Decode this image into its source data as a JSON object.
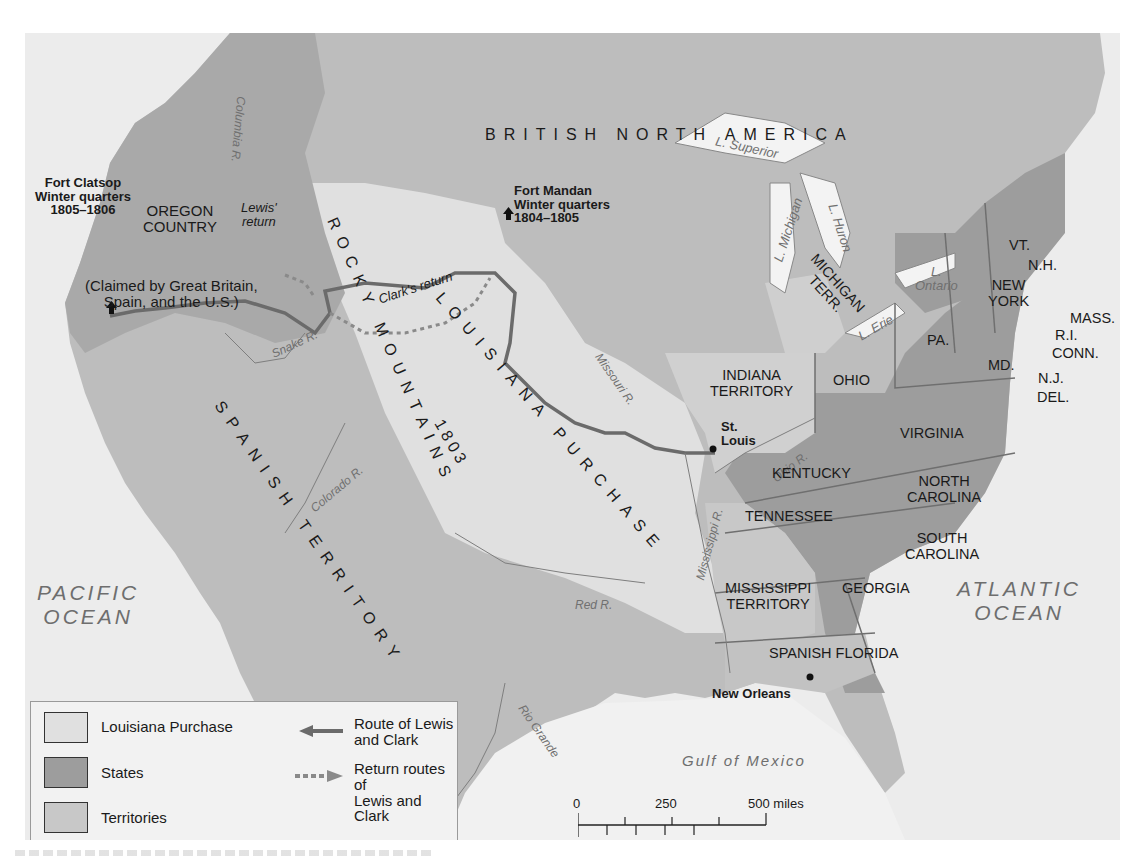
{
  "map": {
    "title_region": "BRITISH NORTH AMERICA",
    "colors": {
      "background": "#ececec",
      "louisiana_purchase": "#e0e0e0",
      "states": "#9d9d9d",
      "territories": "#c8c8c8",
      "spanish_territory": "#bdbdbd",
      "water": "#f3f3f3",
      "route": "#6b6b6b",
      "return_route": "#8a8a8a"
    },
    "oceans": {
      "pacific": [
        "PACIFIC",
        "OCEAN"
      ],
      "atlantic": [
        "ATLANTIC",
        "OCEAN"
      ],
      "gulf": "Gulf of Mexico"
    },
    "regions": {
      "oregon_country": [
        "OREGON",
        "COUNTRY"
      ],
      "oregon_claim": [
        "(Claimed by Great Britain,",
        "Spain, and the U.S.)"
      ],
      "rocky_mountains": "ROCKY MOUNTAINS",
      "louisiana_purchase": "LOUISIANA PURCHASE",
      "louisiana_year": "1803",
      "spanish_territory": "SPANISH TERRITORY"
    },
    "forts": [
      {
        "name": "Fort Clatsop",
        "sub": "Winter quarters",
        "years": "1805–1806"
      },
      {
        "name": "Fort Mandan",
        "sub": "Winter quarters",
        "years": "1804–1805"
      }
    ],
    "cities": {
      "st_louis": [
        "St.",
        "Louis"
      ],
      "new_orleans": "New Orleans"
    },
    "route_labels": {
      "lewis_return": [
        "Lewis'",
        "return"
      ],
      "clark_return": "Clark's return"
    },
    "rivers": {
      "columbia": "Columbia R.",
      "snake": "Snake R.",
      "colorado": "Colorado R.",
      "missouri": "Missouri R.",
      "mississippi": "Mississippi R.",
      "ohio": "Ohio R.",
      "red": "Red R.",
      "rio_grande": "Rio Grande"
    },
    "lakes": {
      "superior": "L. Superior",
      "michigan": "L. Michigan",
      "huron": "L. Huron",
      "erie": "L. Erie",
      "ontario": [
        "L.",
        "Ontario"
      ]
    },
    "states": {
      "vt": "VT.",
      "nh": "N.H.",
      "mass": "MASS.",
      "ri": "R.I.",
      "conn": "CONN.",
      "ny": [
        "NEW",
        "YORK"
      ],
      "nj": "N.J.",
      "pa": "PA.",
      "md": "MD.",
      "del": "DEL.",
      "ohio": "OHIO",
      "virginia": "VIRGINIA",
      "kentucky": "KENTUCKY",
      "nc": [
        "NORTH",
        "CAROLINA"
      ],
      "tennessee": "TENNESSEE",
      "sc": [
        "SOUTH",
        "CAROLINA"
      ],
      "georgia": "GEORGIA"
    },
    "territories": {
      "michigan": [
        "MICHIGAN",
        "TERR."
      ],
      "indiana": [
        "INDIANA",
        "TERRITORY"
      ],
      "mississippi": [
        "MISSISSIPPI",
        "TERRITORY"
      ],
      "spanish_florida": "SPANISH FLORIDA"
    }
  },
  "legend": {
    "items": [
      {
        "label": "Louisiana Purchase",
        "color": "#e0e0e0"
      },
      {
        "label": "States",
        "color": "#9d9d9d"
      },
      {
        "label": "Territories",
        "color": "#c8c8c8"
      }
    ],
    "routes": [
      {
        "label": [
          "Route of Lewis",
          "and Clark"
        ]
      },
      {
        "label": [
          "Return routes of",
          "Lewis and Clark"
        ]
      }
    ]
  },
  "scale": {
    "miles": [
      "0",
      "250",
      "500 miles"
    ],
    "km": [
      "0",
      "250",
      "500 kilometers"
    ]
  }
}
